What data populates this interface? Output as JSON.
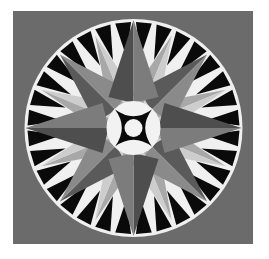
{
  "image": {
    "subject": "Mariner's Compass quilt block",
    "caption": "Mariner's Compass quilt block"
  },
  "layout": {
    "square": {
      "x": 13,
      "y": 11,
      "w": 240,
      "h": 233
    },
    "center": {
      "x": 133.5,
      "y": 128
    },
    "ring_radius": 109,
    "hub_radius": 27,
    "inner_dot_radius": 9
  },
  "colors": {
    "background": "#ffffff",
    "square": "#6b6b6b",
    "ring": "#f0f0f0",
    "rim_triangles": "#0a0a0a",
    "cardinal_dark": "#4e4e4e",
    "cardinal_light": "#7c7c7c",
    "diagonal_dark": "#5a5a5a",
    "diagonal_light": "#8a8a8a",
    "minor_dark": "#a8a8a8",
    "minor_light": "#cdcdcd",
    "hub": "#f2f2f2",
    "hub_star": "#0a0a0a"
  },
  "compass": {
    "points": 16,
    "rim_triangle_count": 32,
    "cardinal_length": 108,
    "diagonal_length": 104,
    "minor_length": 100,
    "cardinal_half_width": 17,
    "diagonal_half_width": 15,
    "minor_half_width": 9
  }
}
